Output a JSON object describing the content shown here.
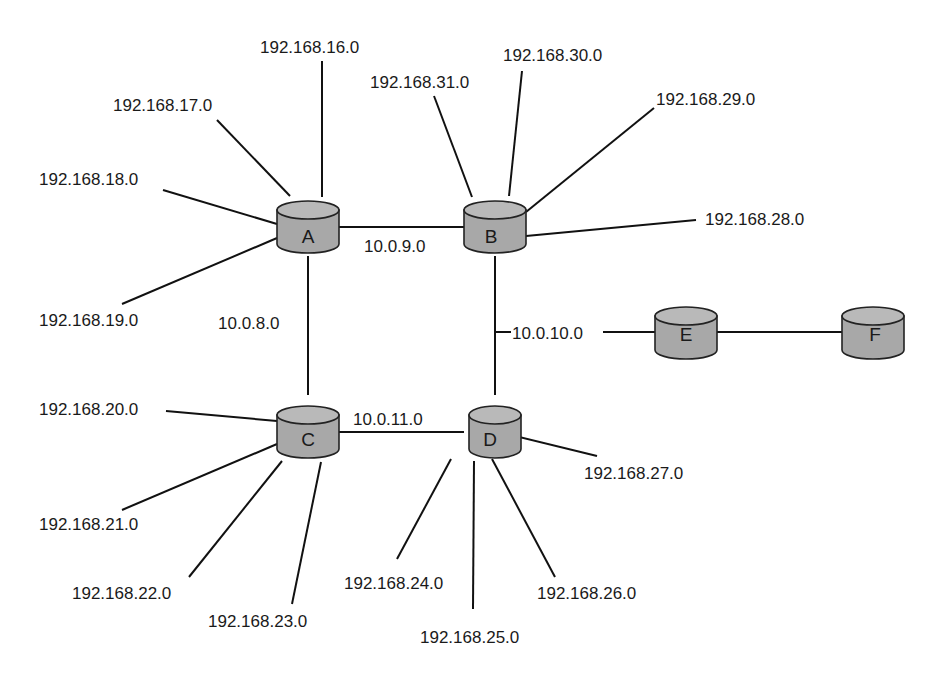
{
  "diagram": {
    "type": "network-topology",
    "routers": [
      {
        "id": "A",
        "label": "A",
        "cx": 308,
        "cy": 227
      },
      {
        "id": "B",
        "label": "B",
        "cx": 495,
        "cy": 227
      },
      {
        "id": "C",
        "label": "C",
        "cx": 308,
        "cy": 424
      },
      {
        "id": "D",
        "label": "D",
        "cx": 495,
        "cy": 424
      },
      {
        "id": "E",
        "label": "E",
        "cx": 686,
        "cy": 333
      },
      {
        "id": "F",
        "label": "F",
        "cx": 873,
        "cy": 333
      }
    ],
    "transit_links": [
      {
        "from": "A",
        "to": "B",
        "network": "10.0.9.0"
      },
      {
        "from": "A",
        "to": "C",
        "network": "10.0.8.0"
      },
      {
        "from": "B",
        "to": "D",
        "network": "10.0.10.0"
      },
      {
        "from": "C",
        "to": "D",
        "network": "10.0.11.0"
      },
      {
        "from": "E",
        "to": "F",
        "network": ""
      }
    ],
    "stub_networks": {
      "A": [
        "192.168.16.0",
        "192.168.17.0",
        "192.168.18.0",
        "192.168.19.0"
      ],
      "B": [
        "192.168.28.0",
        "192.168.29.0",
        "192.168.30.0",
        "192.168.31.0"
      ],
      "C": [
        "192.168.20.0",
        "192.168.21.0",
        "192.168.22.0",
        "192.168.23.0"
      ],
      "D": [
        "192.168.24.0",
        "192.168.25.0",
        "192.168.26.0",
        "192.168.27.0"
      ]
    },
    "labels": {
      "a_16": "192.168.16.0",
      "a_17": "192.168.17.0",
      "a_18": "192.168.18.0",
      "a_19": "192.168.19.0",
      "b_31": "192.168.31.0",
      "b_30": "192.168.30.0",
      "b_29": "192.168.29.0",
      "b_28": "192.168.28.0",
      "c_20": "192.168.20.0",
      "c_21": "192.168.21.0",
      "c_22": "192.168.22.0",
      "c_23": "192.168.23.0",
      "d_24": "192.168.24.0",
      "d_25": "192.168.25.0",
      "d_26": "192.168.26.0",
      "d_27": "192.168.27.0",
      "ab": "10.0.9.0",
      "ac": "10.0.8.0",
      "bd": "10.0.10.0",
      "cd": "10.0.11.0",
      "router_a": "A",
      "router_b": "B",
      "router_c": "C",
      "router_d": "D",
      "router_e": "E",
      "router_f": "F"
    },
    "colors": {
      "router_fill": "#a8a8a8",
      "line": "#111111",
      "text": "#1a1a1a",
      "background": "#ffffff"
    }
  }
}
